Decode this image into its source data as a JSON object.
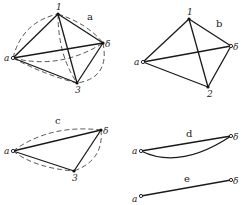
{
  "panels": [
    {
      "id": "a",
      "label": "a",
      "nodes": [
        {
          "name": "1",
          "label": "1",
          "x": 58,
          "y": 14
        },
        {
          "name": "b",
          "label": "δ",
          "x": 103,
          "y": 43
        },
        {
          "name": "a",
          "label": "a",
          "x": 13,
          "y": 58
        },
        {
          "name": "3",
          "label": "3",
          "x": 77,
          "y": 83
        }
      ],
      "solid_edges": [
        [
          "1",
          "b"
        ],
        [
          "1",
          "a"
        ],
        [
          "1",
          "3"
        ],
        [
          "a",
          "b"
        ],
        [
          "a",
          "3"
        ],
        [
          "b",
          "3"
        ]
      ],
      "dashed_edges": [
        "a-1 arc",
        "1-b arc",
        "1-3 arc",
        "a-b arc",
        "a-3 arc",
        "b-3 arc"
      ]
    },
    {
      "id": "b",
      "label": "b",
      "nodes": [
        {
          "name": "1",
          "label": "1",
          "x": 189,
          "y": 19
        },
        {
          "name": "b",
          "label": "δ",
          "x": 231,
          "y": 46
        },
        {
          "name": "a",
          "label": "a",
          "x": 143,
          "y": 62
        },
        {
          "name": "2",
          "label": "2",
          "x": 208,
          "y": 87
        }
      ],
      "solid_edges": [
        [
          "1",
          "b"
        ],
        [
          "1",
          "a"
        ],
        [
          "1",
          "2"
        ],
        [
          "a",
          "b"
        ],
        [
          "a",
          "2"
        ],
        [
          "b",
          "2"
        ]
      ]
    },
    {
      "id": "c",
      "label": "c",
      "nodes": [
        {
          "name": "a",
          "label": "a",
          "x": 13,
          "y": 151
        },
        {
          "name": "b",
          "label": "δ",
          "x": 101,
          "y": 130
        },
        {
          "name": "3",
          "label": "3",
          "x": 74,
          "y": 171
        }
      ],
      "solid_edges": [
        [
          "a",
          "b"
        ],
        [
          "a",
          "3"
        ],
        [
          "b",
          "3"
        ]
      ],
      "dashed_edges": [
        "a-b arc",
        "a-3 arc",
        "b-3 arc"
      ]
    },
    {
      "id": "d",
      "label": "d",
      "nodes": [
        {
          "name": "a",
          "label": "a",
          "x": 141,
          "y": 151
        },
        {
          "name": "b",
          "label": "δ",
          "x": 231,
          "y": 136
        }
      ],
      "solid_edges": [
        [
          "a",
          "b"
        ]
      ],
      "curved_edges": [
        "a-b lower arc"
      ]
    },
    {
      "id": "e",
      "label": "e",
      "nodes": [
        {
          "name": "a",
          "label": "a",
          "x": 141,
          "y": 196
        },
        {
          "name": "b",
          "label": "δ",
          "x": 231,
          "y": 180
        }
      ],
      "solid_edges": [
        [
          "a",
          "b"
        ]
      ]
    }
  ],
  "labels": {
    "a": "a",
    "b": "b",
    "c": "c",
    "d": "d",
    "e": "e",
    "n1": "1",
    "n2": "2",
    "n3": "3",
    "na": "a",
    "nb": "δ"
  }
}
